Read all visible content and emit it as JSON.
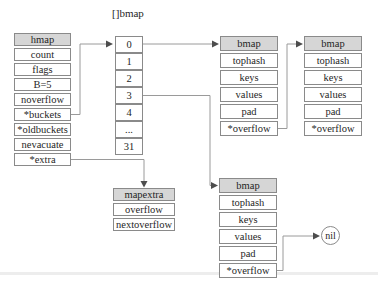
{
  "colors": {
    "header_fill": "#d6d6d6",
    "cell_fill": "#ffffff",
    "border": "#8a8a8a",
    "connector_line": "#9a9a9a",
    "arrowhead": "#4d4d4d",
    "text": "#1f1f1f"
  },
  "hmap": {
    "header": "hmap",
    "rows": [
      "count",
      "flags",
      "B=5",
      "noverflow",
      "*buckets",
      "*oldbuckets",
      "nevacuate",
      "*extra"
    ]
  },
  "bucket_array": {
    "label": "[]bmap",
    "cells": [
      "0",
      "1",
      "2",
      "3",
      "4",
      "...",
      "31"
    ]
  },
  "bmap_top_first": {
    "header": "bmap",
    "rows": [
      "tophash",
      "keys",
      "values",
      "pad",
      "*overflow"
    ]
  },
  "bmap_top_second": {
    "header": "bmap",
    "rows": [
      "tophash",
      "keys",
      "values",
      "pad",
      "*overflow"
    ]
  },
  "bmap_bottom": {
    "header": "bmap",
    "rows": [
      "tophash",
      "keys",
      "values",
      "pad",
      "*overflow"
    ]
  },
  "mapextra": {
    "header": "mapextra",
    "rows": [
      "overflow",
      "nextoverflow"
    ]
  },
  "nil": {
    "label": "nil"
  }
}
